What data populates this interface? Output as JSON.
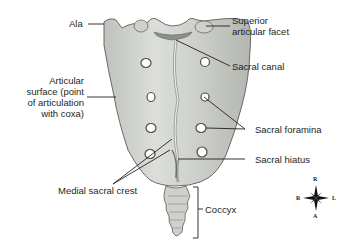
{
  "diagram": {
    "bone_color": "#d4d6d2",
    "bone_shadow": "#9a9c98",
    "outline_color": "#5a5c58",
    "leader_color": "#231f20",
    "labels": {
      "ala": "Ala",
      "superior_articular_facet_line1": "Superior",
      "superior_articular_facet_line2": "articular facet",
      "sacral_canal": "Sacral canal",
      "articular_surface_line1": "Articular",
      "articular_surface_line2": "surface (point",
      "articular_surface_line3": "of articulation",
      "articular_surface_line4": "with coxa)",
      "sacral_foramina": "Sacral foramina",
      "sacral_hiatus": "Sacral hiatus",
      "medial_sacral_crest": "Medial sacral crest",
      "coccyx": "Coccyx"
    },
    "compass": {
      "top": "R",
      "left": "R",
      "right": "L",
      "bottom": "A"
    }
  }
}
